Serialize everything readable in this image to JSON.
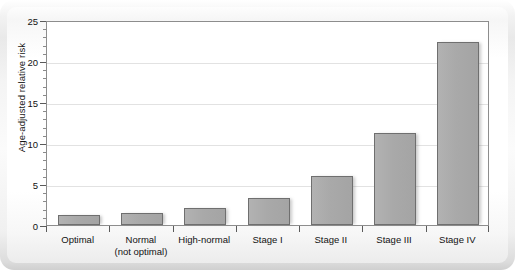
{
  "chart_data": {
    "type": "bar",
    "title": "",
    "xlabel": "",
    "ylabel": "Age-adjusted relative risk",
    "ylim": [
      0,
      25
    ],
    "grid": true,
    "legend": "none",
    "y_ticks": [
      0,
      5,
      10,
      15,
      20,
      25
    ],
    "y_tick_labels": [
      "0",
      "5",
      "10",
      "15",
      "20",
      "25"
    ],
    "y_minor_tick_step": 1,
    "categories": [
      "Optimal",
      "Normal\n(not optimal)",
      "High-normal",
      "Stage I",
      "Stage II",
      "Stage III",
      "Stage IV"
    ],
    "values": [
      1.2,
      1.5,
      2.1,
      3.3,
      6.0,
      11.2,
      22.3
    ],
    "bar_color": "#a9a9a9",
    "bar_border_color": "#6f6f6f",
    "plot_border_color": "#8d8d8d",
    "gridline_color": "#e2e2e2"
  },
  "axes": {
    "y_title": "Age-adjusted relative risk",
    "y_labels": [
      "25",
      "20",
      "15",
      "10",
      "5",
      "0"
    ]
  },
  "categories": [
    {
      "line1": "Optimal",
      "line2": "",
      "value": 1.2
    },
    {
      "line1": "Normal",
      "line2": "(not optimal)",
      "value": 1.5
    },
    {
      "line1": "High-normal",
      "line2": "",
      "value": 2.1
    },
    {
      "line1": "Stage I",
      "line2": "",
      "value": 3.3
    },
    {
      "line1": "Stage II",
      "line2": "",
      "value": 6.0
    },
    {
      "line1": "Stage III",
      "line2": "",
      "value": 11.2
    },
    {
      "line1": "Stage IV",
      "line2": "",
      "value": 22.3
    }
  ]
}
